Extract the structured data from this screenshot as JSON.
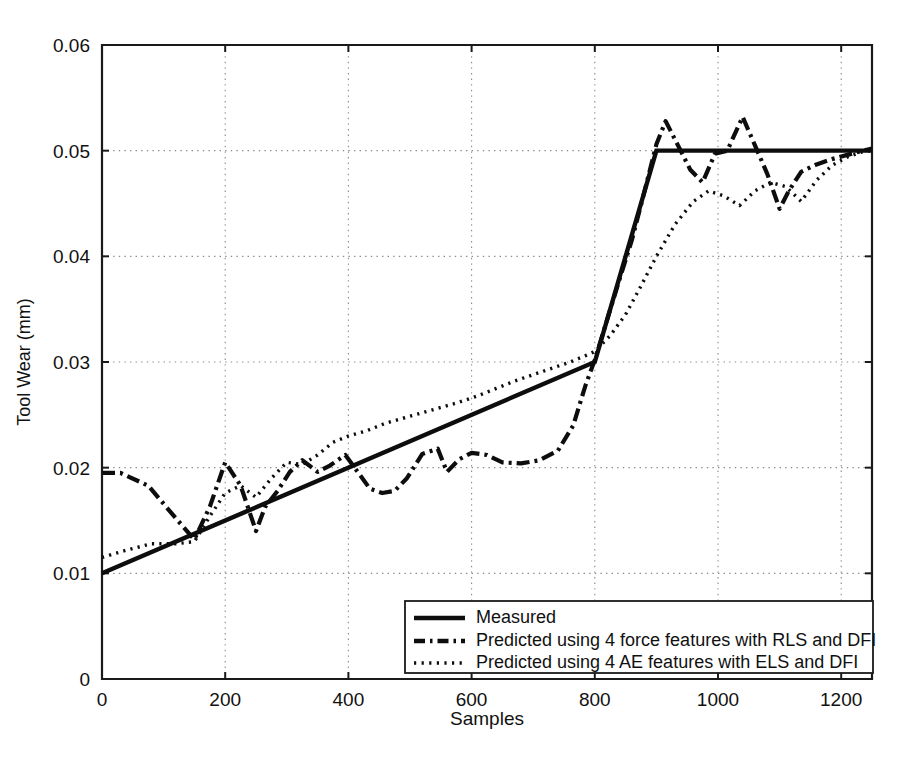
{
  "chart_data": {
    "type": "line",
    "title": "",
    "xlabel": "Samples",
    "ylabel": "Tool Wear (mm)",
    "xlim": [
      0,
      1250
    ],
    "ylim": [
      0,
      0.06
    ],
    "xticks": [
      0,
      200,
      400,
      600,
      800,
      1000,
      1200
    ],
    "xtick_labels": [
      "0",
      "200",
      "400",
      "600",
      "800",
      "1000",
      "1200"
    ],
    "yticks": [
      0,
      0.01,
      0.02,
      0.03,
      0.04,
      0.05,
      0.06
    ],
    "ytick_labels": [
      "0",
      "0.01",
      "0.02",
      "0.03",
      "0.04",
      "0.05",
      "0.06"
    ],
    "grid": true,
    "grid_style": "dotted",
    "legend_position": "lower right",
    "series": [
      {
        "name": "Measured",
        "style": "solid",
        "color": "#0d0d0d",
        "x": [
          0,
          800,
          900,
          1250
        ],
        "y": [
          0.01,
          0.03,
          0.05,
          0.05
        ]
      },
      {
        "name": "Predicted using 4 force features with RLS and DFI",
        "style": "dash-dot",
        "color": "#0d0d0d",
        "x": [
          0,
          30,
          75,
          120,
          150,
          175,
          200,
          225,
          250,
          265,
          285,
          305,
          325,
          350,
          370,
          395,
          415,
          435,
          455,
          475,
          495,
          520,
          545,
          560,
          580,
          600,
          625,
          650,
          680,
          710,
          740,
          765,
          785,
          800,
          820,
          840,
          860,
          880,
          900,
          915,
          935,
          955,
          975,
          995,
          1015,
          1040,
          1060,
          1080,
          1100,
          1115,
          1135,
          1160,
          1185,
          1210,
          1235,
          1250
        ],
        "y": [
          0.0195,
          0.0195,
          0.0183,
          0.0152,
          0.0132,
          0.0163,
          0.0205,
          0.0183,
          0.014,
          0.0163,
          0.0178,
          0.0196,
          0.0207,
          0.0196,
          0.0202,
          0.0212,
          0.0196,
          0.018,
          0.0176,
          0.0178,
          0.019,
          0.0213,
          0.0218,
          0.0196,
          0.0208,
          0.0214,
          0.0212,
          0.0205,
          0.0204,
          0.0207,
          0.0216,
          0.024,
          0.0278,
          0.0302,
          0.034,
          0.0378,
          0.0415,
          0.046,
          0.0506,
          0.0528,
          0.0505,
          0.0482,
          0.047,
          0.0497,
          0.05,
          0.0532,
          0.0505,
          0.0478,
          0.0445,
          0.0462,
          0.048,
          0.0487,
          0.0492,
          0.0496,
          0.05,
          0.0502
        ]
      },
      {
        "name": "Predicted using 4 AE features with ELS and DFI",
        "style": "dotted",
        "color": "#0d0d0d",
        "x": [
          0,
          40,
          80,
          120,
          150,
          175,
          200,
          225,
          250,
          275,
          300,
          325,
          350,
          375,
          400,
          430,
          460,
          490,
          520,
          550,
          580,
          610,
          640,
          670,
          700,
          730,
          760,
          785,
          800,
          825,
          850,
          875,
          900,
          930,
          960,
          985,
          1010,
          1035,
          1060,
          1085,
          1110,
          1135,
          1160,
          1185,
          1210,
          1235,
          1250
        ],
        "y": [
          0.0115,
          0.0122,
          0.0128,
          0.0128,
          0.013,
          0.0154,
          0.0176,
          0.0183,
          0.0172,
          0.019,
          0.0205,
          0.0203,
          0.0212,
          0.0224,
          0.023,
          0.0235,
          0.0242,
          0.0247,
          0.0252,
          0.0257,
          0.0262,
          0.0268,
          0.0275,
          0.0282,
          0.0288,
          0.0294,
          0.03,
          0.0306,
          0.031,
          0.0325,
          0.0345,
          0.0372,
          0.04,
          0.043,
          0.0452,
          0.0462,
          0.0457,
          0.0448,
          0.0462,
          0.047,
          0.0466,
          0.0452,
          0.0472,
          0.0486,
          0.0494,
          0.0499,
          0.05
        ]
      }
    ],
    "legend_entries": [
      {
        "label": "Measured",
        "style": "solid"
      },
      {
        "label": "Predicted using 4 force features with RLS and DFI",
        "style": "dash-dot"
      },
      {
        "label": "Predicted using 4 AE features with ELS and DFI",
        "style": "dotted"
      }
    ]
  }
}
